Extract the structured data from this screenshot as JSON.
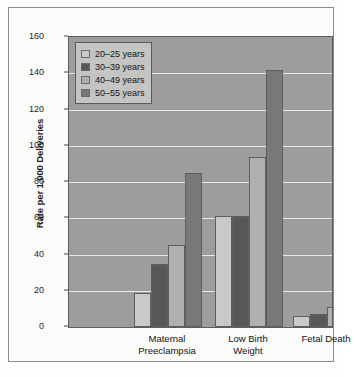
{
  "chart_data": {
    "type": "bar",
    "title": "",
    "xlabel": "",
    "ylabel": "Rate per 1,000 Deliveries",
    "ylim": [
      0,
      160
    ],
    "yticks": [
      0,
      20,
      40,
      60,
      80,
      100,
      120,
      140,
      160
    ],
    "grid": true,
    "legend_position": "top-left",
    "categories": [
      "Maternal Preeclampsia",
      "Low Birth Weight",
      "Fetal Death"
    ],
    "category_lines": [
      [
        "Maternal",
        "Preeclampsia"
      ],
      [
        "Low Birth",
        "Weight"
      ],
      [
        "Fetal Death",
        ""
      ]
    ],
    "series": [
      {
        "name": "20–25 years",
        "color": "#c9c9c7",
        "values": [
          19,
          61,
          6
        ]
      },
      {
        "name": "30–39 years",
        "color": "#585858",
        "values": [
          35,
          61,
          7
        ]
      },
      {
        "name": "40–49 years",
        "color": "#b0b0ae",
        "values": [
          45,
          94,
          11
        ]
      },
      {
        "name": "50–55 years",
        "color": "#787878",
        "values": [
          85,
          142,
          25
        ]
      }
    ]
  },
  "colors": {
    "plot_background": "#9d9d9d",
    "gridline": "#e8e8e6",
    "axis": "#5d5d5d",
    "legend_background": "#c4c4c2",
    "figure_background": "#fbfbfa",
    "text": "#141414"
  }
}
